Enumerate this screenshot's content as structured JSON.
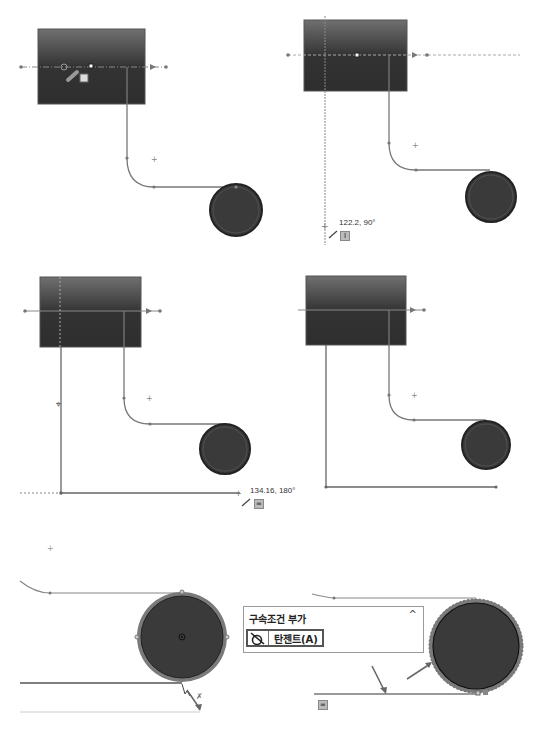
{
  "panels": [
    {
      "id": "step-1",
      "description": "Sketch with block, path and circle; line tool cursor on centerline"
    },
    {
      "id": "step-2",
      "description": "Vertical line being drawn downward from block",
      "dimension_label": "122.2, 90°",
      "relation_badge": "I"
    },
    {
      "id": "step-3",
      "description": "Horizontal line being drawn to the right",
      "dimension_label": "134.16, 180°",
      "relation_badge": "="
    },
    {
      "id": "step-4",
      "description": "Completed L-shaped line below block"
    },
    {
      "id": "step-5",
      "description": "Selecting bottom line and circle to add relation"
    },
    {
      "id": "step-6",
      "description": "Tangent relation applied between line and circle",
      "relation_badge": "="
    }
  ],
  "popup": {
    "title": "구속조건 부가",
    "collapse_icon": "chevron-up-icon",
    "button_label": "탄젠트(A)",
    "button_icon": "tangent-icon"
  },
  "colors": {
    "block_top": "#6e6e6e",
    "block_bottom": "#2e2e2e",
    "circle_fill": "#3a3a3a",
    "line": "#7a7a7a",
    "highlight": "#9a9a9a"
  }
}
